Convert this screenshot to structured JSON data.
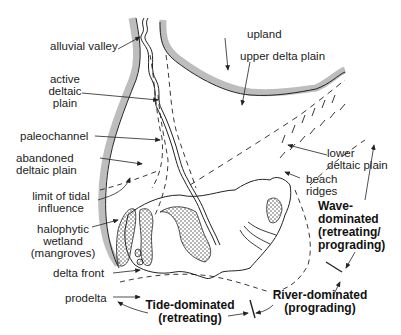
{
  "figure": {
    "colors": {
      "upland_border": "#bdbdbd",
      "line": "#222222",
      "background": "#ffffff"
    }
  },
  "labels": {
    "alluvial_valley": "alluvial valley",
    "upland": "upland",
    "upper_delta_plain": "upper delta plain",
    "active_deltaic_plain_1": "active",
    "active_deltaic_plain_2": "deltaic",
    "active_deltaic_plain_3": "plain",
    "paleochannel": "paleochannel",
    "abandoned_1": "abandoned",
    "abandoned_2": "deltaic plain",
    "limit_tidal_1": "limit of tidal",
    "limit_tidal_2": "influence",
    "halophytic_1": "halophytic",
    "halophytic_2": "wetland",
    "halophytic_3": "(mangroves)",
    "lower_deltaic_1": "lower",
    "lower_deltaic_2": "deltaic plain",
    "beach_ridges_1": "beach",
    "beach_ridges_2": "ridges",
    "delta_front": "delta front",
    "prodelta": "prodelta"
  },
  "regimes": {
    "wave_1": "Wave-",
    "wave_2": "dominated",
    "wave_3": "(retreating/",
    "wave_4": "prograding)",
    "river_1": "River-dominated",
    "river_2": "(prograding)",
    "tide_1": "Tide-dominated",
    "tide_2": "(retreating)"
  }
}
